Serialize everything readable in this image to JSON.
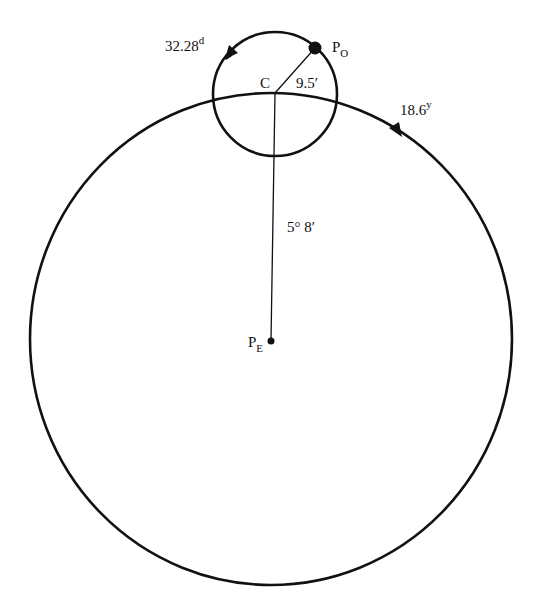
{
  "diagram": {
    "labels": {
      "moon_period": "32.28",
      "moon_period_unit": "d",
      "node_period": "18.6",
      "node_period_unit": "y",
      "center": "C",
      "small_radius": "9.5′",
      "inclination": "5° 8′",
      "orbit_pole_main": "P",
      "orbit_pole_sub": "O",
      "ecliptic_pole_main": "P",
      "ecliptic_pole_sub": "E"
    },
    "colors": {
      "stroke": "#111111",
      "background": "#ffffff"
    }
  }
}
